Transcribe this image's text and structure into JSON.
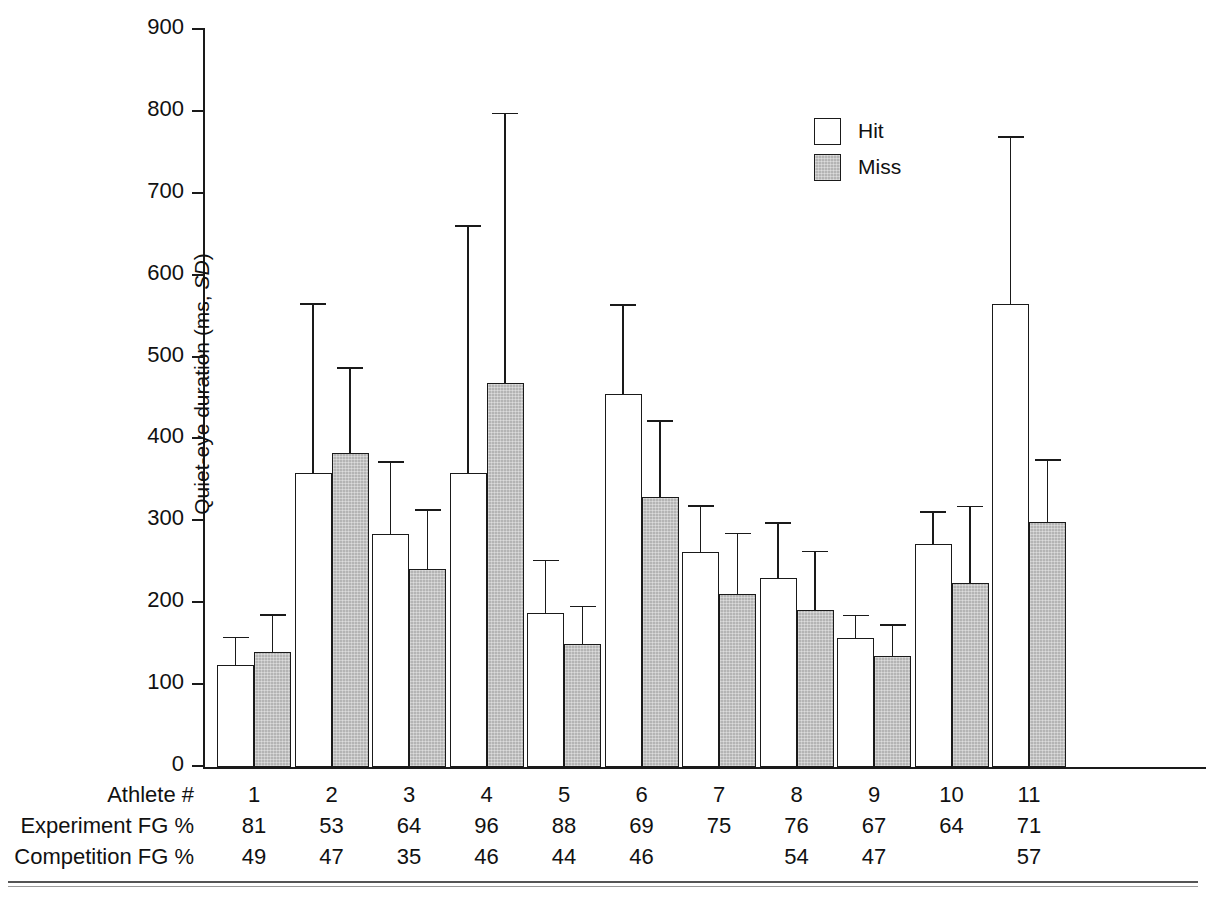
{
  "chart_data": {
    "type": "bar",
    "title": "",
    "xlabel": "Athlete #",
    "ylabel": "Quiet-eye duration (ms, SD)",
    "ylim": [
      0,
      900
    ],
    "ytick_values": [
      0,
      100,
      200,
      300,
      400,
      500,
      600,
      700,
      800,
      900
    ],
    "ytick_labels": [
      "0",
      "100",
      "200",
      "300",
      "400",
      "500",
      "600",
      "700",
      "800",
      "900"
    ],
    "grid": false,
    "legend_position": "top-right",
    "categories": [
      "1",
      "2",
      "3",
      "4",
      "5",
      "6",
      "7",
      "8",
      "9",
      "10",
      "11"
    ],
    "series": [
      {
        "name": "Hit",
        "color": "#ffffff",
        "values": [
          125,
          359,
          284,
          359,
          188,
          455,
          262,
          231,
          158,
          272,
          565
        ],
        "errors": [
          32,
          205,
          87,
          301,
          63,
          108,
          56,
          66,
          26,
          38,
          203
        ],
        "error_tops": [
          157,
          564,
          371,
          660,
          251,
          563,
          318,
          297,
          184,
          310,
          768
        ]
      },
      {
        "name": "Miss",
        "color": "#b4b4b4",
        "values": [
          141,
          384,
          242,
          469,
          150,
          330,
          211,
          192,
          135,
          225,
          299
        ],
        "errors": [
          44,
          102,
          71,
          328,
          45,
          91,
          73,
          70,
          37,
          92,
          75
        ],
        "error_tops": [
          185,
          486,
          313,
          797,
          195,
          421,
          284,
          262,
          172,
          317,
          374
        ]
      }
    ]
  },
  "legend": {
    "items": [
      {
        "label": "Hit",
        "style": "hit"
      },
      {
        "label": "Miss",
        "style": "miss"
      }
    ]
  },
  "axis": {
    "y_title_text": "Quiet-eye duration (ms, ",
    "y_title_italic": "SD",
    "y_title_tail": ")"
  },
  "table": {
    "rows": [
      {
        "label": "Athlete #",
        "values": [
          "1",
          "2",
          "3",
          "4",
          "5",
          "6",
          "7",
          "8",
          "9",
          "10",
          "11"
        ]
      },
      {
        "label": "Experiment FG %",
        "values": [
          "81",
          "53",
          "64",
          "96",
          "88",
          "69",
          "75",
          "76",
          "67",
          "64",
          "71"
        ]
      },
      {
        "label": "Competition FG %",
        "values": [
          "49",
          "47",
          "35",
          "46",
          "44",
          "46",
          "",
          "54",
          "47",
          "",
          "57"
        ]
      }
    ]
  }
}
